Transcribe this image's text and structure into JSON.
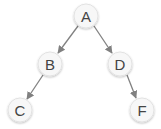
{
  "diagram": {
    "type": "tree",
    "colors": {
      "node_fill": "#f7f7f7",
      "node_stroke": "#e2e2e2",
      "edge": "#808080",
      "label": "#444444"
    },
    "nodes": [
      {
        "id": "A",
        "label": "A",
        "x": 86,
        "y": 16
      },
      {
        "id": "B",
        "label": "B",
        "x": 50,
        "y": 64
      },
      {
        "id": "D",
        "label": "D",
        "x": 120,
        "y": 64
      },
      {
        "id": "C",
        "label": "C",
        "x": 20,
        "y": 110
      },
      {
        "id": "F",
        "label": "F",
        "x": 142,
        "y": 110
      }
    ],
    "edges": [
      {
        "from": "A",
        "to": "B"
      },
      {
        "from": "A",
        "to": "D"
      },
      {
        "from": "B",
        "to": "C"
      },
      {
        "from": "D",
        "to": "F"
      }
    ]
  }
}
